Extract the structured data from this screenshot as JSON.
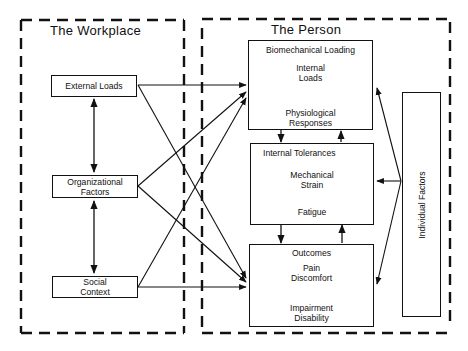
{
  "workplace": {
    "title": "The Workplace",
    "factors": [
      {
        "id": "external-loads",
        "label": "External Loads"
      },
      {
        "id": "organizational-factors",
        "label": "Organizational\nFactors",
        "lines": [
          "Organizational",
          "Factors"
        ]
      },
      {
        "id": "social-context",
        "label": "Social\nContext",
        "lines": [
          "Social",
          "Context"
        ]
      }
    ]
  },
  "person": {
    "title": "The Person",
    "biomechanical_loading": {
      "heading": "Biomechanical Loading",
      "top_item": [
        "Internal",
        "Loads"
      ],
      "bottom_item": [
        "Physiological",
        "Responses"
      ]
    },
    "internal_tolerances": {
      "heading": "Internal Tolerances",
      "top_item": [
        "Mechanical",
        "Strain"
      ],
      "bottom_item": [
        "Fatigue"
      ]
    },
    "outcomes": {
      "heading": "Outcomes",
      "top_item": [
        "Pain",
        "Discomfort"
      ],
      "bottom_item": [
        "Impairment",
        "Disability"
      ]
    },
    "individual_factors": {
      "label": "Individual Factors"
    }
  },
  "connections": [
    {
      "from": "External Loads",
      "to": "Organizational Factors",
      "type": "bidirectional"
    },
    {
      "from": "Organizational Factors",
      "to": "Social Context",
      "type": "bidirectional"
    },
    {
      "from": "External Loads",
      "to": "Biomechanical Loading"
    },
    {
      "from": "External Loads",
      "to": "Outcomes"
    },
    {
      "from": "Organizational Factors",
      "to": "Biomechanical Loading"
    },
    {
      "from": "Organizational Factors",
      "to": "Outcomes"
    },
    {
      "from": "Social Context",
      "to": "Biomechanical Loading"
    },
    {
      "from": "Social Context",
      "to": "Outcomes"
    },
    {
      "from": "Internal Loads",
      "to": "Physiological Responses",
      "type": "bidirectional"
    },
    {
      "from": "Mechanical Strain",
      "to": "Fatigue",
      "type": "bidirectional"
    },
    {
      "from": "Pain Discomfort",
      "to": "Impairment Disability"
    },
    {
      "from": "Biomechanical Loading",
      "to": "Internal Tolerances"
    },
    {
      "from": "Internal Tolerances",
      "to": "Biomechanical Loading"
    },
    {
      "from": "Internal Tolerances",
      "to": "Outcomes"
    },
    {
      "from": "Outcomes",
      "to": "Internal Tolerances"
    },
    {
      "from": "Individual Factors",
      "to": "Biomechanical Loading"
    },
    {
      "from": "Individual Factors",
      "to": "Internal Tolerances"
    },
    {
      "from": "Individual Factors",
      "to": "Outcomes"
    }
  ]
}
